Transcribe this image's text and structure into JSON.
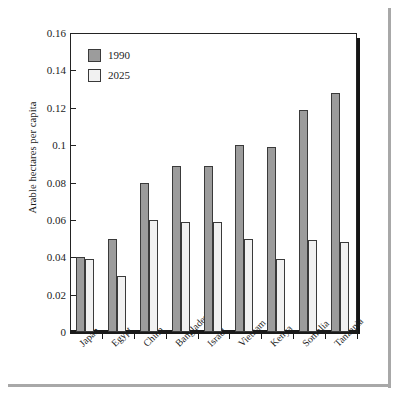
{
  "chart_data": {
    "type": "bar",
    "title": "",
    "xlabel": "",
    "ylabel": "Arable hectares per capita",
    "ylim": [
      0,
      0.16
    ],
    "grid": false,
    "legend_position": "top-left",
    "ytick_labels": [
      "0.16",
      "0.14",
      "0.12",
      "0.1",
      "0.08",
      "0.06",
      "0.04",
      "0.02",
      "0"
    ],
    "ytick_values": [
      0.16,
      0.14,
      0.12,
      0.1,
      0.08,
      0.06,
      0.04,
      0.02,
      0
    ],
    "categories": [
      "Japan",
      "Egypt",
      "China",
      "Bangladesh",
      "Israel",
      "Vietnam",
      "Kenya",
      "Somalia",
      "Tanzania"
    ],
    "series": [
      {
        "name": "1990",
        "color": "#9c9c9c",
        "values": [
          0.04,
          0.05,
          0.08,
          0.089,
          0.089,
          0.1,
          0.099,
          0.119,
          0.128
        ]
      },
      {
        "name": "2025",
        "color": "#f1f1f1",
        "values": [
          0.039,
          0.03,
          0.06,
          0.059,
          0.059,
          0.05,
          0.039,
          0.049,
          0.048
        ]
      }
    ]
  },
  "legend": {
    "items": [
      {
        "label": "1990",
        "swatch": "s1990"
      },
      {
        "label": "2025",
        "swatch": "s2025"
      }
    ]
  }
}
